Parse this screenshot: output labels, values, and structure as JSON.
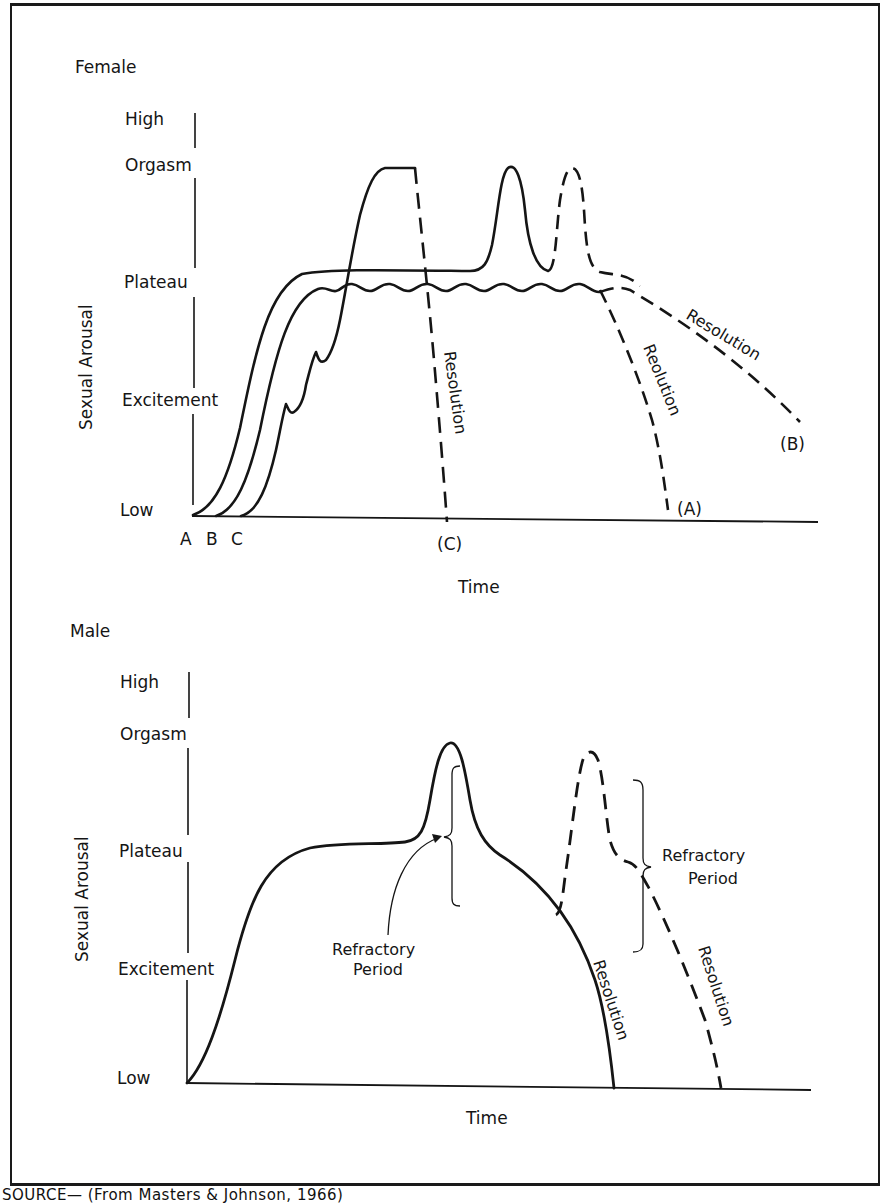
{
  "figure": {
    "source_note": "SOURCE— (From Masters & Johnson, 1966)"
  },
  "female_chart": {
    "title": "Female",
    "y_axis_label": "Sexual Arousal",
    "x_axis_label": "Time",
    "y_levels": [
      "High",
      "Orgasm",
      "Plateau",
      "Excitement",
      "Low"
    ],
    "x_start_markers": [
      "A",
      "B",
      "C"
    ],
    "annotations": {
      "resolution_c": "Resolution",
      "resolution_a": "Reolution",
      "resolution_b": "Resolution",
      "end_a": "(A)",
      "end_b": "(B)",
      "end_c": "(C)"
    }
  },
  "male_chart": {
    "title": "Male",
    "y_axis_label": "Sexual Arousal",
    "x_axis_label": "Time",
    "y_levels": [
      "High",
      "Orgasm",
      "Plateau",
      "Excitement",
      "Low"
    ],
    "annotations": {
      "refractory_1_line1": "Refractory",
      "refractory_1_line2": "Period",
      "refractory_2_line1": "Refractory",
      "refractory_2_line2": "Period",
      "resolution_solid": "Resolution",
      "resolution_dashed": "Resolution"
    }
  },
  "colors": {
    "ink": "#151515",
    "background": "#ffffff"
  }
}
